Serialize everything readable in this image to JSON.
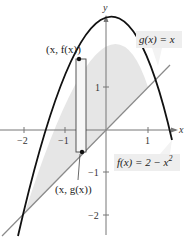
{
  "figure": {
    "type": "area-between-curves",
    "axes": {
      "x_label": "x",
      "y_label": "y",
      "x_ticks": [
        {
          "value": -2,
          "label": "−2"
        },
        {
          "value": -1,
          "label": "−1"
        },
        {
          "value": 1,
          "label": "1"
        }
      ],
      "y_ticks": [
        {
          "value": 1,
          "label": "1"
        },
        {
          "value": -1,
          "label": "−1"
        },
        {
          "value": -2,
          "label": "−2"
        }
      ]
    },
    "curves": {
      "f": {
        "label": "f(x) = 2 − x²",
        "label_main": "f(x) = 2 − x",
        "label_sup": "2",
        "expression": "2 - x^2",
        "color": "#111111"
      },
      "g": {
        "label": "g(x) = x",
        "expression": "x",
        "color": "#888888"
      }
    },
    "region": {
      "from_x": -2,
      "to_x": 1,
      "fill": "#e6e6e6"
    },
    "representative_rectangle": {
      "x": -0.75,
      "top_point_label": "(x, f(x))",
      "bottom_point_label": "(x, g(x))"
    },
    "colors": {
      "label_box": "#eeeeee",
      "axis": "#777777"
    }
  }
}
